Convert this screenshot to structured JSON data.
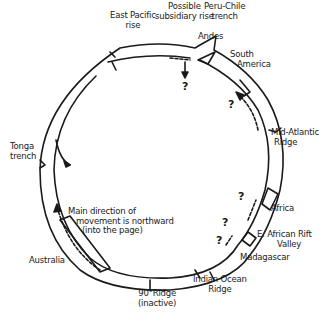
{
  "diagram": {
    "type": "cross-section",
    "labels": {
      "east_pacific_rise": [
        "East Pacific",
        "rise"
      ],
      "possible_subsidiary_rise": [
        "Possible",
        "subsidiary rise"
      ],
      "peru_chile_trench": [
        "Peru-Chile",
        "trench"
      ],
      "andes": "Andes",
      "south_america": [
        "South",
        "America"
      ],
      "mid_atlantic_ridge": [
        "Mid-Atlantic",
        "Ridge"
      ],
      "africa": "Africa",
      "east_african_rift": [
        "E. African Rift",
        "Valley"
      ],
      "madagascar": "Madagascar",
      "indian_ocean_ridge": [
        "Indian Ocean",
        "Ridge"
      ],
      "ninety_ridge": [
        "90°Ridge",
        "(inactive)"
      ],
      "australia": "Australia",
      "tonga_trench": [
        "Tonga",
        "trench"
      ],
      "movement_note": [
        "Main direction of",
        "movement is northward",
        "(into the page)"
      ]
    },
    "question_mark": "?",
    "colors": {
      "line": "#1a1a1a",
      "background": "#ffffff"
    }
  }
}
